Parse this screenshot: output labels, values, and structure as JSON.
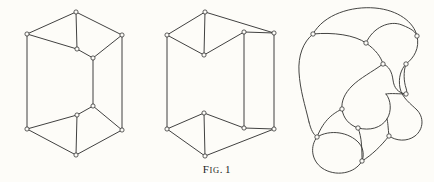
{
  "figure": {
    "caption_prefix": "F",
    "caption_smallcaps": "IG",
    "caption_period": ".",
    "caption_number": "1",
    "caption_full": "Fig. 1",
    "background_color": "#fdfcf8",
    "ink_color": "#2b2b2b",
    "curve_ink_color": "#3a3a38",
    "panel_count": 3
  },
  "panels": [
    {
      "id": "panel-left",
      "name": "prism-wireframe-normal",
      "description": "Line drawing of a hexagonal-outline prism (cube-like box) seen in oblique projection with 12 circular vertex nodes",
      "vertex_count": 12,
      "edge_count": 18,
      "vertices": [
        {
          "label": "top-apex",
          "x": 76,
          "y": 12
        },
        {
          "label": "top-left",
          "x": 27,
          "y": 34
        },
        {
          "label": "top-right",
          "x": 122,
          "y": 35
        },
        {
          "label": "top-mid-front",
          "x": 77,
          "y": 49
        },
        {
          "label": "top-mid-right",
          "x": 93,
          "y": 58
        },
        {
          "label": "mid-right-lower",
          "x": 93,
          "y": 106
        },
        {
          "label": "bot-mid-front",
          "x": 77,
          "y": 115
        },
        {
          "label": "bot-left",
          "x": 27,
          "y": 129
        },
        {
          "label": "bot-right",
          "x": 122,
          "y": 130
        },
        {
          "label": "bot-apex",
          "x": 76,
          "y": 155
        },
        {
          "label": "top-left-dup",
          "x": 27,
          "y": 34
        },
        {
          "label": "bot-left-dup",
          "x": 27,
          "y": 129
        }
      ],
      "edges": [
        "top-left→top-apex",
        "top-apex→top-right",
        "top-left→top-mid-front",
        "top-mid-front→top-mid-right",
        "top-mid-right→top-right",
        "top-apex→top-mid-front",
        "top-left→bot-left",
        "top-right→bot-right",
        "top-mid-right→mid-right-lower",
        "bot-left→bot-mid-front",
        "bot-mid-front→mid-right-lower",
        "mid-right-lower→bot-right",
        "bot-left→bot-apex",
        "bot-apex→bot-right",
        "bot-mid-front→bot-apex"
      ]
    },
    {
      "id": "panel-middle",
      "name": "prism-wireframe-inverted",
      "description": "Line drawing of the same prism with the near face inverted, producing a V-notch at top and bottom and a detached rectangular right face",
      "vertex_count": 12,
      "edge_count": 18,
      "vertices": [
        {
          "label": "top-apex",
          "x": 205,
          "y": 12
        },
        {
          "label": "top-left",
          "x": 167,
          "y": 35
        },
        {
          "label": "top-notch",
          "x": 204,
          "y": 55
        },
        {
          "label": "top-right-inner",
          "x": 244,
          "y": 32
        },
        {
          "label": "top-right-outer",
          "x": 274,
          "y": 33
        },
        {
          "label": "mid-right-inner-low",
          "x": 244,
          "y": 128
        },
        {
          "label": "mid-right-outer-low",
          "x": 274,
          "y": 129
        },
        {
          "label": "bot-notch",
          "x": 204,
          "y": 113
        },
        {
          "label": "bot-left",
          "x": 167,
          "y": 129
        },
        {
          "label": "bot-apex",
          "x": 205,
          "y": 156
        },
        {
          "label": "left-vertical-top",
          "x": 167,
          "y": 35
        },
        {
          "label": "left-vertical-bot",
          "x": 167,
          "y": 129
        }
      ],
      "edges": [
        "top-left→top-apex",
        "top-apex→top-right-outer",
        "top-left→top-notch",
        "top-notch→top-right-inner",
        "top-right-inner→top-right-outer",
        "top-apex→top-notch",
        "top-left→bot-left",
        "top-right-inner→mid-right-inner-low",
        "top-right-outer→mid-right-outer-low",
        "mid-right-inner-low→mid-right-outer-low",
        "bot-left→bot-notch",
        "bot-notch→mid-right-inner-low",
        "bot-left→bot-apex",
        "bot-apex→mid-right-outer-low",
        "bot-notch→bot-apex"
      ]
    },
    {
      "id": "panel-right",
      "name": "prism-graph-curvilinear",
      "description": "Topologically equivalent curvilinear blob diagram of the same prism graph drawn with smooth bulging arcs and small circular vertex nodes",
      "vertex_count": 12,
      "edge_count": 18
    }
  ]
}
